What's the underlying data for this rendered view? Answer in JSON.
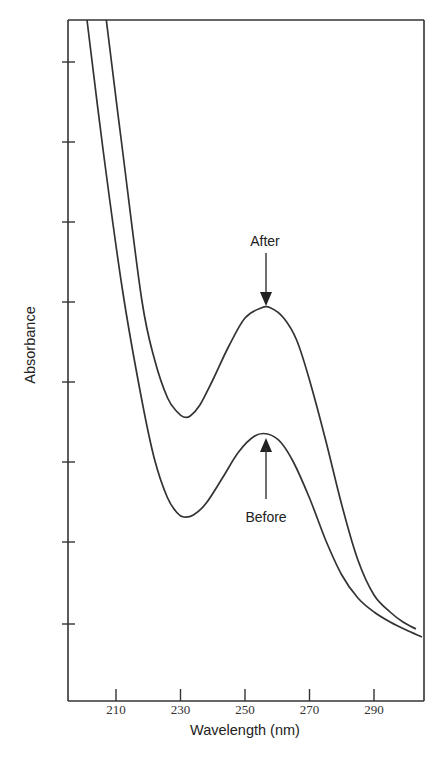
{
  "chart_data": {
    "type": "line",
    "title": "",
    "xlabel": "Wavelength (nm)",
    "ylabel": "Absorbance",
    "xlim": [
      195,
      305
    ],
    "x_ticks": [
      210,
      230,
      250,
      270,
      290
    ],
    "y_ticks_count": 8,
    "y_tick_labels": [],
    "grid": false,
    "legend": null,
    "series": [
      {
        "name": "After",
        "x": [
          207,
          212,
          218,
          222,
          226,
          229,
          231,
          233,
          236,
          240,
          245,
          250,
          255,
          258,
          262,
          266,
          270,
          275,
          280,
          285,
          290,
          295,
          299,
          303
        ],
        "y_px": [
          20,
          150,
          300,
          360,
          398,
          412,
          417,
          416,
          405,
          380,
          346,
          318,
          308,
          308,
          318,
          340,
          380,
          440,
          505,
          560,
          595,
          612,
          622,
          629
        ]
      },
      {
        "name": "Before",
        "x": [
          201,
          206,
          212,
          218,
          222,
          226,
          229,
          231,
          234,
          238,
          243,
          248,
          253,
          257,
          261,
          265,
          270,
          275,
          280,
          285,
          290,
          295,
          300,
          305
        ],
        "y_px": [
          20,
          150,
          290,
          400,
          460,
          498,
          513,
          517,
          515,
          503,
          478,
          452,
          436,
          434,
          442,
          462,
          498,
          540,
          575,
          598,
          612,
          622,
          630,
          637
        ]
      }
    ],
    "annotations": [
      {
        "text": "After",
        "x": 257,
        "points_to": "After peak (~257 nm)",
        "direction": "down"
      },
      {
        "text": "Before",
        "x": 257,
        "points_to": "Before peak (~257 nm)",
        "direction": "up"
      }
    ]
  },
  "labels": {
    "xlabel": "Wavelength (nm)",
    "ylabel": "Absorbance",
    "x_ticks": [
      "210",
      "230",
      "250",
      "270",
      "290"
    ],
    "after": "After",
    "before": "Before"
  }
}
